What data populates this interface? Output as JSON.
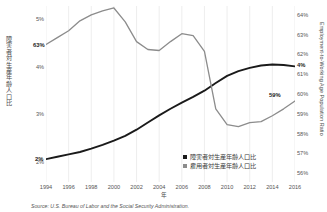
{
  "chart_data": {
    "type": "line",
    "title": "",
    "xlabel": "年",
    "source": "Source: U.S. Bureau of Labor and the Social Security Administration.",
    "grid": true,
    "legend_position": "bottom-right",
    "x": [
      1994,
      1995,
      1996,
      1997,
      1998,
      1999,
      2000,
      2001,
      2002,
      2003,
      2004,
      2005,
      2006,
      2007,
      2008,
      2009,
      2010,
      2011,
      2012,
      2013,
      2014,
      2015,
      2016
    ],
    "xticks": [
      "1994",
      "1996",
      "1998",
      "2000",
      "2002",
      "2004",
      "2006",
      "2008",
      "2010",
      "2012",
      "2014",
      "2016"
    ],
    "xlim": [
      1994,
      2016
    ],
    "left_axis": {
      "label": "障害者対生産年齢人口比",
      "ticks": [
        "5%",
        "4%",
        "3%",
        "2%"
      ],
      "tick_values": [
        5,
        4,
        3,
        2
      ],
      "lim": [
        1.6,
        5.3
      ]
    },
    "right_axis": {
      "label": "Employment-to-Working Age Population Ratio",
      "ticks": [
        "64%",
        "63%",
        "62%",
        "61%",
        "60%",
        "59%",
        "58%",
        "57%",
        "56%"
      ],
      "tick_values": [
        64,
        63,
        62,
        61,
        60,
        59,
        58,
        57,
        56
      ],
      "lim": [
        55.6,
        64.5
      ]
    },
    "series": [
      {
        "name": "障害者対生産年齢人口比",
        "axis": "left",
        "color": "#1a1a1a",
        "end_label": "4%",
        "start_label": "2%",
        "values": [
          2.08,
          2.13,
          2.18,
          2.23,
          2.3,
          2.38,
          2.47,
          2.57,
          2.7,
          2.85,
          3.0,
          3.14,
          3.27,
          3.39,
          3.52,
          3.68,
          3.83,
          3.93,
          4.0,
          4.05,
          4.07,
          4.06,
          4.03
        ]
      },
      {
        "name": "雇用者対生産年齢人口比",
        "axis": "right",
        "color": "#8c8c8c",
        "end_label": "59%",
        "start_label": "63%",
        "values": [
          62.55,
          62.9,
          63.25,
          63.75,
          64.05,
          64.25,
          64.4,
          63.7,
          62.7,
          62.3,
          62.25,
          62.7,
          63.1,
          63.0,
          62.2,
          59.3,
          58.5,
          58.4,
          58.6,
          58.65,
          58.95,
          59.3,
          59.7
        ]
      }
    ]
  },
  "labels": {
    "left_axis_title": "障害者対生産年齢人口比",
    "right_axis_title": "Employment-to-Working Age Population Ratio",
    "x_axis_title": "年",
    "legend": [
      {
        "text": "障害者対生産年齢人口比",
        "color": "#1a1a1a"
      },
      {
        "text": "雇用者対生産年齢人口比",
        "color": "#8c8c8c"
      }
    ],
    "annotations": {
      "gray_start": "63%",
      "gray_end": "59%",
      "black_start": "2%",
      "black_end": "4%"
    },
    "source": "Source: U.S. Bureau of Labor and the Social Security Administration."
  }
}
